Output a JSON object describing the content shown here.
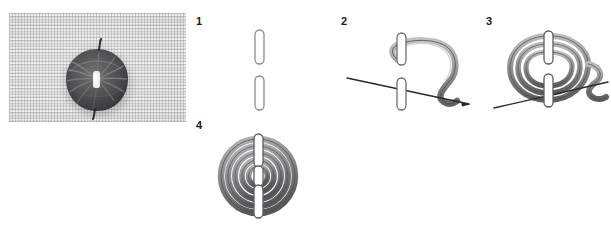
{
  "document": {
    "title": "Woven Wheel Stitch — step diagram",
    "background_color": "#ffffff",
    "top_caption_partial": "···  ·····   ·· ····· ·· ····"
  },
  "photo": {
    "label": "finished-stitch-photograph",
    "alt": "Close-up photograph of a dark woven wheel stitch embroidered on pale woven linen fabric",
    "fabric_color": "#ececeb",
    "thread_color": "#3a3a3c",
    "highlight_color": "#f2f2f0"
  },
  "steps": [
    {
      "number": "1",
      "name": "step-one-two-straight-stitches",
      "description": "Two vertical straight foundation stitches worked one above the other",
      "outline_color": "#8c8c90",
      "fill_color": "#ffffff"
    },
    {
      "number": "2",
      "name": "step-two-needle-weaves-first-pass",
      "description": "Needle passes under the foundation stitches and the thread wraps around to begin weaving",
      "outline_color": "#4f4f52",
      "thread_color": "#9a9a9e",
      "needle_color": "#2a2a2c"
    },
    {
      "number": "3",
      "name": "step-three-continue-weaving",
      "description": "Weaving continues, building up concentric loops around the foundation stitches",
      "outline_color": "#4f4f52",
      "thread_color": "#8f8f93",
      "needle_color": "#2a2a2c"
    },
    {
      "number": "4",
      "name": "step-four-completed-woven-wheel",
      "description": "Completed woven wheel — a filled spiral of thread covering the foundation stitches",
      "outline_color": "#4f4f52",
      "thread_color": "#8a8a8e"
    }
  ],
  "colors": {
    "page_background": "#ffffff",
    "number_text": "#1a1a1a",
    "line_gray": "#808085",
    "thread_light": "#b8b8bc",
    "thread_mid": "#8f8f93",
    "thread_dark": "#555558"
  }
}
